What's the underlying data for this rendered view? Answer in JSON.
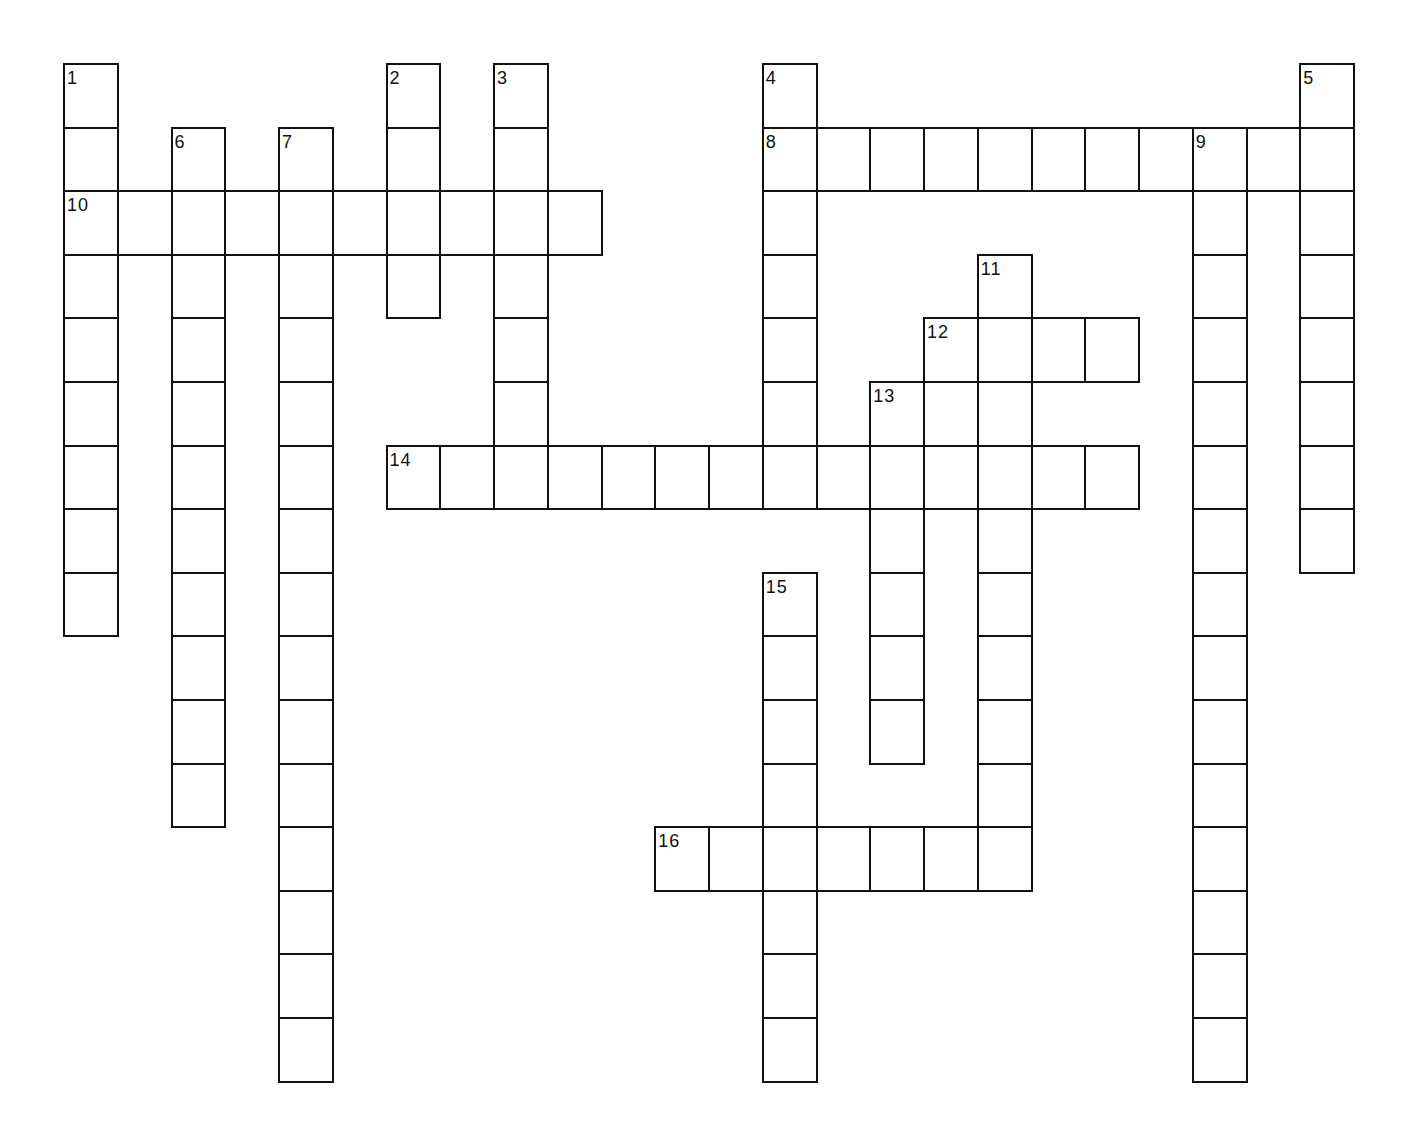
{
  "puzzle": {
    "type": "crossword",
    "grid": {
      "origin_x": 64,
      "origin_y": 64,
      "cell_w": 53.75,
      "cell_h": 63.6,
      "border_color": "#111111",
      "shaded_color": "#b4b4b4"
    },
    "entries": [
      {
        "number": "1",
        "direction": "down",
        "row": 0,
        "col": 0,
        "length": 9
      },
      {
        "number": "2",
        "direction": "down",
        "row": 0,
        "col": 6,
        "length": 4
      },
      {
        "number": "3",
        "direction": "down",
        "row": 0,
        "col": 8,
        "length": 7
      },
      {
        "number": "4",
        "direction": "down",
        "row": 0,
        "col": 13,
        "length": 7
      },
      {
        "number": "5",
        "direction": "down",
        "row": 0,
        "col": 23,
        "length": 8
      },
      {
        "number": "6",
        "direction": "down",
        "row": 1,
        "col": 2,
        "length": 11
      },
      {
        "number": "7",
        "direction": "down",
        "row": 1,
        "col": 4,
        "length": 15
      },
      {
        "number": "8",
        "direction": "across",
        "row": 1,
        "col": 13,
        "length": 11
      },
      {
        "number": "9",
        "direction": "down",
        "row": 1,
        "col": 21,
        "length": 15
      },
      {
        "number": "10",
        "direction": "across",
        "row": 2,
        "col": 0,
        "length": 10
      },
      {
        "number": "11",
        "direction": "down",
        "row": 3,
        "col": 17,
        "length": 10
      },
      {
        "number": "12",
        "direction": "across",
        "row": 4,
        "col": 16,
        "length": 4
      },
      {
        "number": "13",
        "direction": "down",
        "row": 5,
        "col": 15,
        "length": 6
      },
      {
        "number": "14",
        "direction": "across",
        "row": 6,
        "col": 6,
        "length": 14
      },
      {
        "number": "15",
        "direction": "down",
        "row": 8,
        "col": 13,
        "length": 8
      },
      {
        "number": "16",
        "direction": "across",
        "row": 12,
        "col": 11,
        "length": 7
      }
    ],
    "shaded_cells": [
      {
        "row": 5,
        "col": 16
      }
    ]
  }
}
